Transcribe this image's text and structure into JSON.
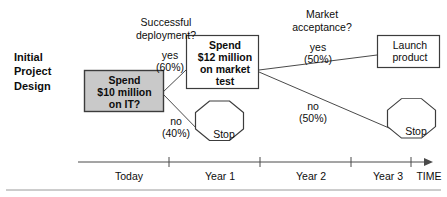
{
  "diagram": {
    "title": "Initial Project Design",
    "root_label": "Initial\nProject\nDesign",
    "colors": {
      "decision_box_fill": "#c9c9c9",
      "box_stroke": "#3c3c3c",
      "line": "#4a4a4a",
      "text": "#0d0d0d",
      "background": "#ffffff",
      "rule": "#9a9a9a"
    },
    "nodes": {
      "invest_it": {
        "shape": "rectangle",
        "fill": "shaded",
        "label": "Spend\n$10 million\non IT?"
      },
      "market_test": {
        "shape": "rectangle",
        "fill": "white",
        "label": "Spend\n$12 million\non market\ntest"
      },
      "launch": {
        "shape": "rectangle",
        "fill": "white",
        "label": "Launch\nproduct"
      },
      "stop_first": {
        "shape": "octagon",
        "label": "Stop"
      },
      "stop_second": {
        "shape": "octagon",
        "label": "Stop"
      }
    },
    "questions": [
      {
        "id": "deployment",
        "text": "Successful\ndeployment?"
      },
      {
        "id": "acceptance",
        "text": "Market\nacceptance?"
      }
    ],
    "branches": [
      {
        "id": "deploy-yes",
        "outcome": "yes",
        "probability": "(60%)",
        "label": "yes\n(60%)",
        "from": "invest_it",
        "to": "market_test"
      },
      {
        "id": "deploy-no",
        "outcome": "no",
        "probability": "(40%)",
        "label": "no\n(40%)",
        "from": "invest_it",
        "to": "stop_first"
      },
      {
        "id": "accept-yes",
        "outcome": "yes",
        "probability": "(50%)",
        "label": "yes\n(50%)",
        "from": "market_test",
        "to": "launch"
      },
      {
        "id": "accept-no",
        "outcome": "no",
        "probability": "(50%)",
        "label": "no\n(50%)",
        "from": "market_test",
        "to": "stop_second"
      }
    ],
    "timeline": {
      "axis_name": "TIME",
      "ticks": [
        "Today",
        "Year 1",
        "Year 2",
        "Year 3"
      ]
    }
  }
}
